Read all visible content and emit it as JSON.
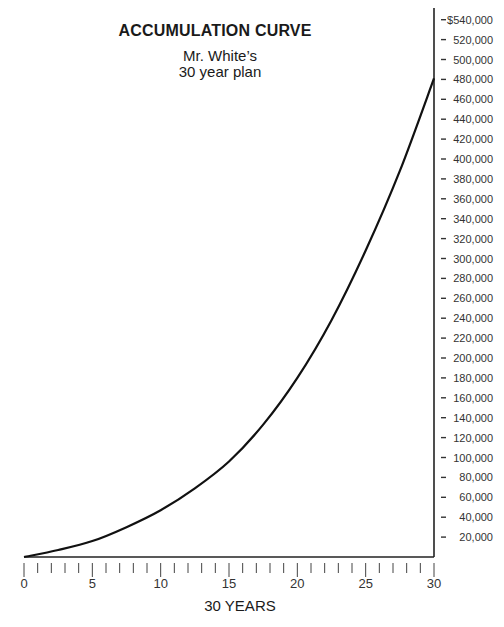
{
  "chart_data": {
    "type": "line",
    "title": "ACCUMULATION CURVE",
    "subtitle_lines": [
      "Mr. White’s",
      "30 year plan"
    ],
    "xlabel": "30 YEARS",
    "ylabel": "",
    "x_ticks": [
      0,
      5,
      10,
      15,
      20,
      25,
      30
    ],
    "x_minor_ticks_per_year": true,
    "xlim": [
      0,
      30
    ],
    "ylim": [
      0,
      540000
    ],
    "y_tick_labels": [
      "$540,000",
      "520,000",
      "500,000",
      "480,000",
      "460,000",
      "440,000",
      "420,000",
      "400,000",
      "380,000",
      "360,000",
      "340,000",
      "320,000",
      "300,000",
      "280,000",
      "260,000",
      "240,000",
      "220,000",
      "200,000",
      "180,000",
      "160,000",
      "140,000",
      "120,000",
      "100,000",
      "80,000",
      "60,000",
      "40,000",
      "20,000"
    ],
    "y_axis_position": "right",
    "grid": false,
    "legend": null,
    "series": [
      {
        "name": "Accumulation",
        "x": [
          0,
          2.5,
          5,
          7.5,
          10,
          12.5,
          15,
          17.5,
          20,
          22.5,
          25,
          27.5,
          30
        ],
        "values": [
          0,
          7000,
          16000,
          30000,
          47000,
          69000,
          96000,
          133000,
          180000,
          238000,
          308000,
          388000,
          481000
        ]
      }
    ]
  }
}
